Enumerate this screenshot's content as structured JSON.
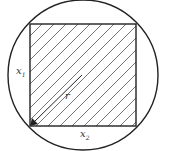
{
  "diagram": {
    "labels": {
      "side_left": "x",
      "side_left_sub": "1",
      "side_bottom": "x",
      "side_bottom_sub": "2",
      "radius": "r"
    },
    "colors": {
      "stroke": "#222222",
      "hatch": "#555555"
    }
  }
}
